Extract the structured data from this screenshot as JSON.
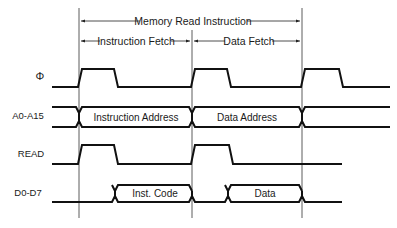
{
  "title_spans": {
    "memory_read": "Memory Read Instruction",
    "instruction_fetch": "Instruction Fetch",
    "data_fetch": "Data Fetch"
  },
  "signals": [
    {
      "label": "Φ"
    },
    {
      "label": "A0-A15",
      "segments": [
        "Instruction Address",
        "Data Address"
      ]
    },
    {
      "label": "READ"
    },
    {
      "label": "D0-D7",
      "segments": [
        "Inst. Code",
        "Data"
      ]
    }
  ],
  "colors": {
    "line": "#111111",
    "background": "#ffffff"
  }
}
